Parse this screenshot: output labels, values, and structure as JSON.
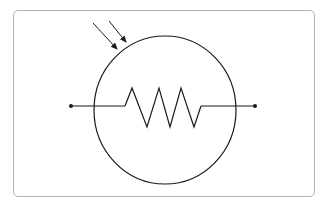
{
  "diagram": {
    "symbol": "light-dependent-resistor",
    "components": {
      "enclosure": "circle",
      "element": "resistor-zigzag",
      "light_arrows": 2,
      "terminals": 2
    },
    "colors": {
      "stroke": "#1a1a1a",
      "frame": "#b4b4b4",
      "background": "#ffffff"
    }
  }
}
